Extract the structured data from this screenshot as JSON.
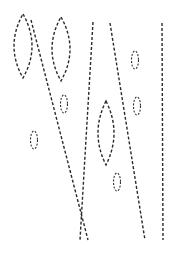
{
  "figure": {
    "width": 176,
    "height": 254,
    "background": "#ffffff",
    "stroke_color": "#2a2a2a",
    "line_style": "dashed",
    "lines": [
      {
        "id": "line-a",
        "x1": 31,
        "y1": 20,
        "x2": 88,
        "y2": 240
      },
      {
        "id": "line-b",
        "x1": 93,
        "y1": 22,
        "x2": 80,
        "y2": 240
      },
      {
        "id": "line-c",
        "x1": 110,
        "y1": 23,
        "x2": 145,
        "y2": 240
      },
      {
        "id": "line-d",
        "x1": 162,
        "y1": 23,
        "x2": 163,
        "y2": 240
      }
    ],
    "lenses": [
      {
        "id": "lens-1",
        "cx": 23,
        "top": 14,
        "bottom": 78,
        "half_width": 9
      },
      {
        "id": "lens-2",
        "cx": 61,
        "top": 17,
        "bottom": 81,
        "half_width": 9
      },
      {
        "id": "lens-3",
        "cx": 106,
        "top": 101,
        "bottom": 165,
        "half_width": 8
      }
    ],
    "ovals": [
      {
        "id": "oval-1",
        "cx": 135,
        "cy": 60,
        "rx": 3.5,
        "ry": 9
      },
      {
        "id": "oval-2",
        "cx": 137,
        "cy": 106,
        "rx": 3.5,
        "ry": 9
      },
      {
        "id": "oval-3",
        "cx": 64,
        "cy": 104,
        "rx": 3.5,
        "ry": 9
      },
      {
        "id": "oval-4",
        "cx": 34,
        "cy": 140,
        "rx": 3.5,
        "ry": 9
      },
      {
        "id": "oval-5",
        "cx": 117,
        "cy": 182,
        "rx": 3.5,
        "ry": 9
      }
    ]
  }
}
